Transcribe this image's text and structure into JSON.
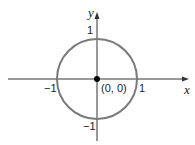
{
  "diagram": {
    "type": "unit-circle-graph",
    "colors": {
      "axis": "#333333",
      "circle": "#7a7a7a",
      "point": "#000000",
      "text": "#222222"
    },
    "axes": {
      "x_label": "x",
      "y_label": "y"
    },
    "ticks": {
      "x_neg": "−1",
      "x_pos": "1",
      "y_pos": "1",
      "y_neg": "−1"
    },
    "center_point": {
      "label": "(0, 0)"
    },
    "circle": {
      "center": [
        0,
        0
      ],
      "radius": 1
    }
  }
}
